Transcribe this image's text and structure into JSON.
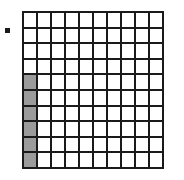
{
  "figure": {
    "title": "",
    "marker": {
      "name": "square-bullet-marker",
      "shape": "filled-square",
      "color": "#1a1a1a",
      "size_px": 5
    },
    "grid": {
      "rows": 10,
      "columns": 10,
      "cell_fill_default": "#ffffff",
      "cell_fill_shaded": "#9b9b9b",
      "line_color": "#1a1a1a",
      "line_width_px": 2,
      "shaded_count": 6,
      "total_count": 100,
      "fraction_shaded": "6/100",
      "shaded_cells": [
        {
          "row": 5,
          "col": 1
        },
        {
          "row": 6,
          "col": 1
        },
        {
          "row": 7,
          "col": 1
        },
        {
          "row": 8,
          "col": 1
        },
        {
          "row": 9,
          "col": 1
        },
        {
          "row": 10,
          "col": 1
        }
      ],
      "cells": [
        [
          0,
          0,
          0,
          0,
          0,
          0,
          0,
          0,
          0,
          0
        ],
        [
          0,
          0,
          0,
          0,
          0,
          0,
          0,
          0,
          0,
          0
        ],
        [
          0,
          0,
          0,
          0,
          0,
          0,
          0,
          0,
          0,
          0
        ],
        [
          0,
          0,
          0,
          0,
          0,
          0,
          0,
          0,
          0,
          0
        ],
        [
          1,
          0,
          0,
          0,
          0,
          0,
          0,
          0,
          0,
          0
        ],
        [
          1,
          0,
          0,
          0,
          0,
          0,
          0,
          0,
          0,
          0
        ],
        [
          1,
          0,
          0,
          0,
          0,
          0,
          0,
          0,
          0,
          0
        ],
        [
          1,
          0,
          0,
          0,
          0,
          0,
          0,
          0,
          0,
          0
        ],
        [
          1,
          0,
          0,
          0,
          0,
          0,
          0,
          0,
          0,
          0
        ],
        [
          1,
          0,
          0,
          0,
          0,
          0,
          0,
          0,
          0,
          0
        ]
      ]
    }
  }
}
